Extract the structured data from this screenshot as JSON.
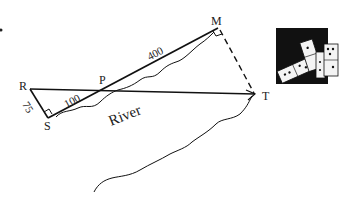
{
  "diagram": {
    "points": {
      "R": "R",
      "S": "S",
      "P": "P",
      "M": "M",
      "T": "T"
    },
    "measures": {
      "RS": "75",
      "SP": "100",
      "PM": "400"
    },
    "river_label": "River",
    "icon": "dominoes-icon",
    "colors": {
      "line": "#111111",
      "icon_bg": "#111111",
      "domino": "#f4f4f4"
    }
  }
}
